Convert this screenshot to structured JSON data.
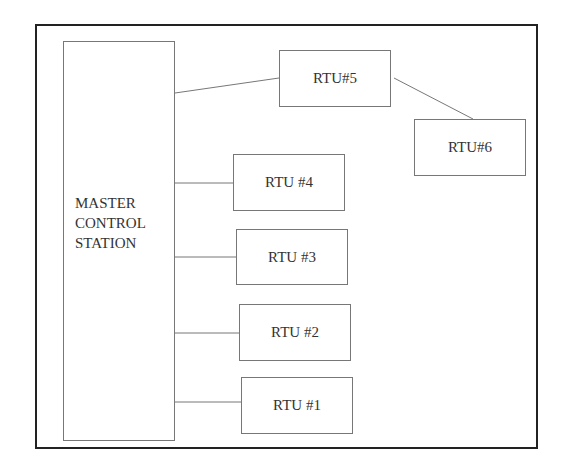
{
  "diagram": {
    "master": {
      "label": "MASTER\nCONTROL\nSTATION"
    },
    "rtus": [
      {
        "id": "rtu1",
        "label": "RTU #1"
      },
      {
        "id": "rtu2",
        "label": "RTU #2"
      },
      {
        "id": "rtu3",
        "label": "RTU #3"
      },
      {
        "id": "rtu4",
        "label": "RTU #4"
      },
      {
        "id": "rtu5",
        "label": "RTU#5"
      },
      {
        "id": "rtu6",
        "label": "RTU#6"
      }
    ],
    "connections": [
      {
        "from": "master",
        "to": "rtu1"
      },
      {
        "from": "master",
        "to": "rtu2"
      },
      {
        "from": "master",
        "to": "rtu3"
      },
      {
        "from": "master",
        "to": "rtu4"
      },
      {
        "from": "master",
        "to": "rtu5"
      },
      {
        "from": "rtu5",
        "to": "rtu6"
      }
    ]
  }
}
